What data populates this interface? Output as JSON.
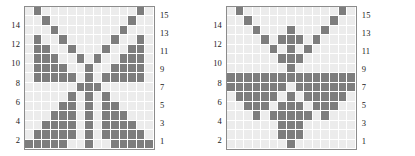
{
  "figure": {
    "panels": [
      {
        "name": "left-panel",
        "left_axis_labels": [
          "14",
          "12",
          "10",
          "8",
          "6",
          "4",
          "2"
        ],
        "right_axis_labels": [
          "15",
          "13",
          "11",
          "9",
          "7",
          "5",
          "3",
          "1"
        ]
      },
      {
        "name": "right-panel",
        "left_axis_labels": [
          "14",
          "12",
          "10",
          "8",
          "6",
          "4",
          "2"
        ],
        "right_axis_labels": [
          "15",
          "13",
          "11",
          "9",
          "7",
          "5",
          "3",
          "1"
        ]
      }
    ]
  },
  "colors": {
    "cell_on": "#7d7d7d",
    "cell_off": "#ececec",
    "grid_line": "#ffffff",
    "border": "#8c8c8c",
    "label": "#1a1a1a",
    "background": "#ffffff"
  },
  "chart_data": [
    {
      "type": "heatmap",
      "title": "",
      "xlabel": "",
      "ylabel": "",
      "grid": true,
      "legend": "none",
      "rows": 15,
      "cols": 15,
      "row_labels_left": [
        "",
        "14",
        "",
        "12",
        "",
        "10",
        "",
        "8",
        "",
        "6",
        "",
        "4",
        "",
        "2",
        ""
      ],
      "row_labels_right": [
        "15",
        "",
        "13",
        "",
        "11",
        "",
        "9",
        "",
        "7",
        "",
        "5",
        "",
        "3",
        "",
        "1"
      ],
      "value_levels": [
        0,
        1
      ],
      "description": "Butterfly / X-shaped binary cellular pattern, 15x15, symmetric about the vertical center column",
      "values": [
        [
          0,
          1,
          0,
          0,
          0,
          0,
          0,
          0,
          0,
          0,
          0,
          0,
          0,
          1,
          0
        ],
        [
          0,
          0,
          1,
          0,
          0,
          0,
          0,
          0,
          0,
          0,
          0,
          0,
          1,
          0,
          0
        ],
        [
          0,
          0,
          0,
          1,
          0,
          0,
          0,
          0,
          0,
          0,
          0,
          1,
          0,
          0,
          0
        ],
        [
          0,
          1,
          0,
          0,
          1,
          0,
          0,
          0,
          0,
          0,
          1,
          0,
          0,
          1,
          0
        ],
        [
          0,
          1,
          1,
          0,
          0,
          1,
          0,
          0,
          0,
          1,
          0,
          0,
          1,
          1,
          0
        ],
        [
          0,
          1,
          1,
          1,
          0,
          0,
          1,
          0,
          1,
          0,
          0,
          1,
          1,
          1,
          0
        ],
        [
          0,
          1,
          1,
          1,
          1,
          0,
          0,
          1,
          0,
          0,
          1,
          1,
          1,
          1,
          0
        ],
        [
          0,
          1,
          1,
          1,
          1,
          1,
          0,
          1,
          0,
          1,
          1,
          1,
          1,
          1,
          0
        ],
        [
          0,
          0,
          0,
          0,
          0,
          0,
          1,
          1,
          1,
          0,
          0,
          0,
          0,
          0,
          0
        ],
        [
          0,
          0,
          0,
          0,
          0,
          1,
          0,
          1,
          0,
          1,
          0,
          0,
          0,
          0,
          0
        ],
        [
          0,
          0,
          0,
          0,
          1,
          1,
          0,
          1,
          0,
          1,
          1,
          0,
          0,
          0,
          0
        ],
        [
          0,
          0,
          0,
          1,
          1,
          1,
          0,
          1,
          0,
          1,
          1,
          1,
          0,
          0,
          0
        ],
        [
          0,
          0,
          1,
          1,
          1,
          1,
          0,
          1,
          0,
          1,
          1,
          1,
          1,
          0,
          0
        ],
        [
          0,
          1,
          1,
          1,
          1,
          1,
          0,
          1,
          0,
          1,
          1,
          1,
          1,
          1,
          0
        ],
        [
          1,
          1,
          1,
          1,
          1,
          0,
          0,
          1,
          0,
          0,
          1,
          1,
          1,
          1,
          1
        ]
      ]
    },
    {
      "type": "heatmap",
      "title": "",
      "xlabel": "",
      "ylabel": "",
      "grid": true,
      "legend": "none",
      "rows": 15,
      "cols": 15,
      "row_labels_left": [
        "",
        "14",
        "",
        "12",
        "",
        "10",
        "",
        "8",
        "",
        "6",
        "",
        "4",
        "",
        "2",
        ""
      ],
      "row_labels_right": [
        "15",
        "",
        "13",
        "",
        "11",
        "",
        "9",
        "",
        "7",
        "",
        "5",
        "",
        "3",
        "",
        "1"
      ],
      "value_levels": [
        0,
        1
      ],
      "description": "Downward arrow / inverted triangle binary cellular pattern, 15x15, with a fully filled horizontal band at row 8",
      "values": [
        [
          0,
          1,
          0,
          0,
          0,
          0,
          0,
          0,
          0,
          0,
          0,
          0,
          0,
          1,
          0
        ],
        [
          0,
          0,
          1,
          0,
          0,
          0,
          0,
          0,
          0,
          0,
          0,
          0,
          1,
          0,
          0
        ],
        [
          0,
          0,
          0,
          1,
          0,
          0,
          0,
          1,
          0,
          0,
          0,
          1,
          0,
          0,
          0
        ],
        [
          0,
          0,
          0,
          0,
          1,
          0,
          1,
          1,
          1,
          0,
          1,
          0,
          0,
          0,
          0
        ],
        [
          0,
          0,
          0,
          0,
          0,
          1,
          0,
          1,
          0,
          1,
          0,
          0,
          0,
          0,
          0
        ],
        [
          0,
          0,
          0,
          0,
          0,
          0,
          1,
          1,
          1,
          0,
          0,
          0,
          0,
          0,
          0
        ],
        [
          0,
          0,
          0,
          0,
          0,
          0,
          0,
          1,
          0,
          0,
          0,
          0,
          0,
          0,
          0
        ],
        [
          1,
          1,
          1,
          1,
          1,
          1,
          1,
          1,
          1,
          1,
          1,
          1,
          1,
          1,
          1
        ],
        [
          1,
          1,
          1,
          1,
          1,
          1,
          1,
          0,
          1,
          1,
          1,
          1,
          1,
          1,
          1
        ],
        [
          0,
          1,
          1,
          1,
          1,
          1,
          0,
          1,
          0,
          1,
          1,
          1,
          1,
          1,
          0
        ],
        [
          0,
          0,
          1,
          1,
          1,
          0,
          1,
          1,
          1,
          0,
          1,
          1,
          1,
          0,
          0
        ],
        [
          0,
          0,
          0,
          1,
          0,
          1,
          1,
          1,
          1,
          1,
          0,
          1,
          0,
          0,
          0
        ],
        [
          0,
          0,
          0,
          0,
          0,
          0,
          1,
          1,
          1,
          0,
          0,
          0,
          0,
          0,
          0
        ],
        [
          0,
          0,
          0,
          0,
          0,
          0,
          1,
          1,
          1,
          0,
          0,
          0,
          0,
          0,
          0
        ],
        [
          0,
          0,
          0,
          0,
          0,
          0,
          0,
          1,
          0,
          0,
          0,
          0,
          0,
          0,
          0
        ]
      ]
    }
  ]
}
